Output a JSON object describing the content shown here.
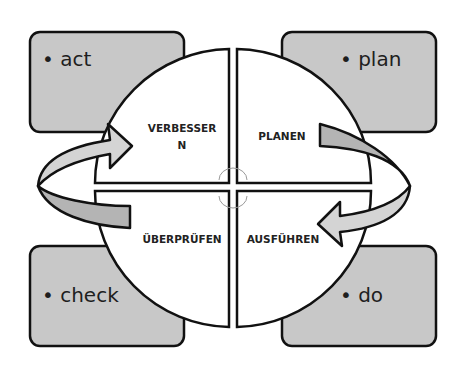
{
  "diagram": {
    "type": "PDCA cycle",
    "colors": {
      "box_fill": "#c8c8c8",
      "arrow_light": "#d4d4d4",
      "arrow_dark": "#b4b4b4",
      "outline": "#111111",
      "quadrant_fill": "#ffffff"
    },
    "corner_boxes": {
      "top_left": "• act",
      "top_right": "• plan",
      "bottom_left": "• check",
      "bottom_right": "• do"
    },
    "quadrants": {
      "top_left_line1": "VERBESSER",
      "top_left_line2": "N",
      "top_right": "PLANEN",
      "bottom_left": "ÜBERPRÜFEN",
      "bottom_right": "AUSFÜHREN"
    }
  }
}
